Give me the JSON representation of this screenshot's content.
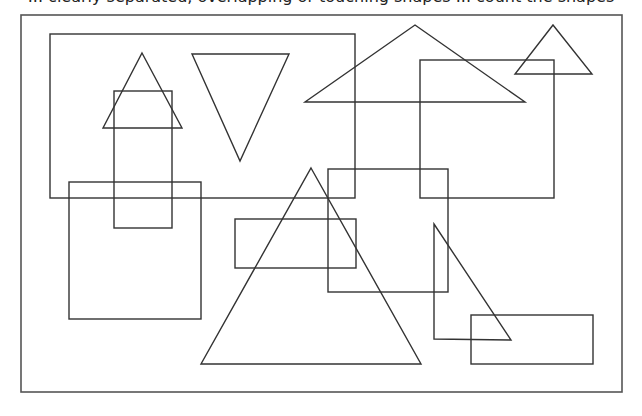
{
  "caption": {
    "text": "... clearly separated, overlapping or touching shapes ... count the shapes",
    "clipped": true
  },
  "canvas": {
    "width": 642,
    "height": 416,
    "stroke_color": "#333333",
    "background": "#ffffff"
  },
  "frame": {
    "x": 21,
    "y": 15,
    "width": 601,
    "height": 377
  },
  "shapes": {
    "rectangles": [
      {
        "id": "rect-large-top-left",
        "x": 50,
        "y": 34,
        "width": 305,
        "height": 164
      },
      {
        "id": "rect-tall-narrow",
        "x": 114,
        "y": 91,
        "width": 58,
        "height": 137
      },
      {
        "id": "rect-square-left",
        "x": 69,
        "y": 182,
        "width": 132,
        "height": 137
      },
      {
        "id": "rect-right-upper",
        "x": 420,
        "y": 60,
        "width": 134,
        "height": 138
      },
      {
        "id": "rect-center",
        "x": 328,
        "y": 169,
        "width": 120,
        "height": 123
      },
      {
        "id": "rect-small-horizontal",
        "x": 235,
        "y": 219,
        "width": 121,
        "height": 49
      },
      {
        "id": "rect-bottom-right",
        "x": 471,
        "y": 315,
        "width": 122,
        "height": 49
      }
    ],
    "triangles": [
      {
        "id": "triangle-small-up-left",
        "points": "142,53 182,128 103,128"
      },
      {
        "id": "triangle-inverted",
        "points": "192,54 289,54 240,161"
      },
      {
        "id": "triangle-wide",
        "points": "415,25 525,102 305,102"
      },
      {
        "id": "triangle-small-top-right",
        "points": "553,25 592,74 515,74"
      },
      {
        "id": "triangle-large-center",
        "points": "311,168 421,364 201,364"
      },
      {
        "id": "triangle-right-angle",
        "points": "434,224 511,340 434,339"
      }
    ]
  },
  "counts": {
    "rectangles": 7,
    "triangles": 6
  }
}
